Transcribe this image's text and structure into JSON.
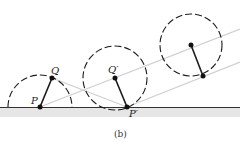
{
  "figure": {
    "caption": "(b)",
    "labels": {
      "P": "P",
      "Q": "Q",
      "Q_prime": "Q′",
      "P_prime": "P′"
    },
    "colors": {
      "stroke": "#1a1a1a",
      "guide_line": "#c8c8c8",
      "ground_band": "#e6e6e6",
      "ground_line": "#333333"
    }
  }
}
